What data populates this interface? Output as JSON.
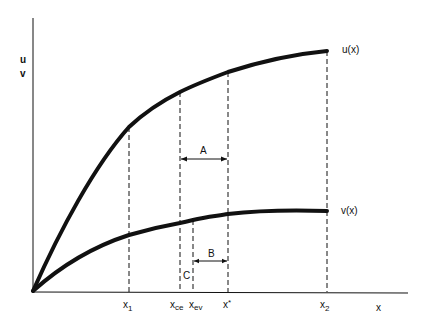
{
  "axes": {
    "y_label_top": "u",
    "y_label_bottom": "v",
    "x_label": "x"
  },
  "curves": {
    "u_label": "u(x)",
    "v_label": "v(x)"
  },
  "ticks": {
    "x1": {
      "base": "x",
      "sub": "1"
    },
    "xce": {
      "base": "x",
      "sub": "ce"
    },
    "xev": {
      "base": "x",
      "sub": "ev"
    },
    "xstar": {
      "base": "x",
      "sup": "*"
    },
    "x2": {
      "base": "x",
      "sub": "2"
    }
  },
  "annotations": {
    "A": "A",
    "B": "B",
    "C": "C"
  },
  "colors": {
    "ink": "#111111",
    "background": "#ffffff"
  }
}
